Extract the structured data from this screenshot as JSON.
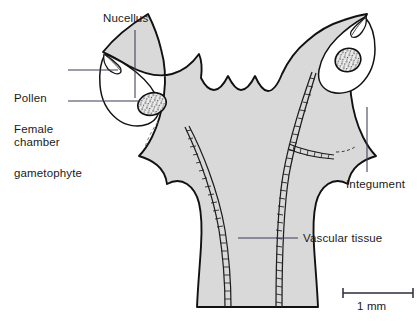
{
  "figure": {
    "kind": "botanical-cross-section-diagram",
    "background_color": "#ffffff",
    "tissue_fill_color": "#d9d9d9",
    "outline_color": "#111111",
    "nucellus_fill_color": "#ffffff",
    "gametophyte_fill_color": "#e8e8e8",
    "leader_line_color": "#3a3a56"
  },
  "labels": {
    "nucellus": "Nucellus",
    "pollen_chamber_line1": "Pollen",
    "pollen_chamber_line2": "chamber",
    "female_gametophyte_line1": "Female",
    "female_gametophyte_line2": "gametophyte",
    "integument": "Integument",
    "vascular_tissue": "Vascular tissue"
  },
  "scale_bar": {
    "label": "1 mm",
    "length_px": 70,
    "value": 1,
    "unit": "mm"
  },
  "structures": [
    {
      "name": "left-ovule",
      "parts": [
        "integument",
        "nucellus",
        "pollen-chamber",
        "female-gametophyte"
      ]
    },
    {
      "name": "right-ovule",
      "parts": [
        "integument",
        "nucellus",
        "pollen-chamber",
        "female-gametophyte"
      ]
    },
    {
      "name": "central-stalk",
      "parts": [
        "vascular-tissue-left-strand",
        "vascular-tissue-right-strand"
      ]
    }
  ]
}
